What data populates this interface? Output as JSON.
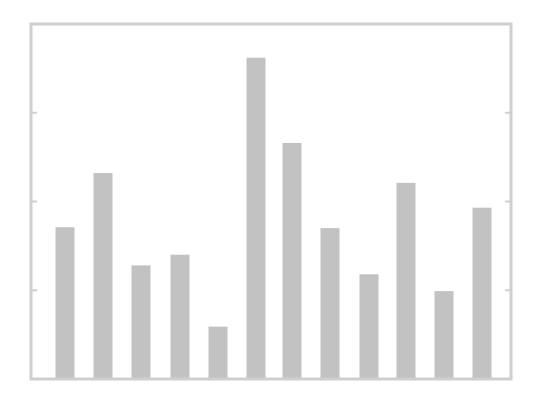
{
  "chart_data": {
    "type": "bar",
    "title": "",
    "xlabel": "",
    "ylabel": "",
    "categories": [
      "1",
      "2",
      "3",
      "4",
      "5",
      "6",
      "7",
      "8",
      "9",
      "10",
      "11",
      "12"
    ],
    "values": [
      1.71,
      2.32,
      1.28,
      1.4,
      0.59,
      3.62,
      2.66,
      1.7,
      1.18,
      2.21,
      0.99,
      1.93
    ],
    "ylim": [
      0,
      4
    ],
    "yticks": [
      1,
      2,
      3
    ],
    "ytick_labels_visible": false,
    "xtick_labels_visible": false,
    "grid": false,
    "legend": null,
    "bar_color": "#c2c2c2",
    "frame_color": "#cfcfcf"
  },
  "layout": {
    "plot_left": 31,
    "plot_right": 511,
    "plot_top": 24,
    "plot_bottom": 379,
    "bar_width": 19,
    "bar_centers": [
      65,
      103,
      141,
      180,
      218,
      256,
      292,
      330,
      369,
      406,
      444,
      482
    ]
  }
}
